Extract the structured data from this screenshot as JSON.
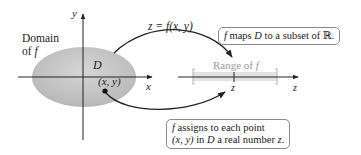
{
  "diagram": {
    "domain_label_line1": "Domain",
    "domain_label_line2_prefix": "of ",
    "domain_label_line2_var": "f",
    "region_label": "D",
    "point_label": "(x, y)",
    "axis_x_label": "x",
    "axis_y_label": "y",
    "function_label": "z = f(x, y)",
    "range_label_prefix": "Range of ",
    "range_label_var": "f",
    "range_point_label": "z",
    "z_axis_label": "z",
    "callout_top": {
      "var": "f",
      "text": " maps ",
      "set": "D",
      "text2": " to a subset of ℝ."
    },
    "callout_bottom": {
      "line1_var": "f",
      "line1_text": " assigns to each point",
      "line2_point": "(x, y)",
      "line2_text": " in ",
      "line2_set": "D",
      "line2_text2": " a real number ",
      "line2_var": "z",
      "line2_end": "."
    },
    "colors": {
      "domain_fill": "#c4c4c4",
      "range_fill": "#e2e2e2",
      "axis": "#222222",
      "callout_border": "#8a8a8a",
      "range_text": "#9a9a9a"
    }
  }
}
